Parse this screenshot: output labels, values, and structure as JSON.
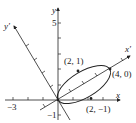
{
  "axes": {
    "x_label": "x",
    "y_label": "y",
    "xprime_label": "x′",
    "yprime_label": "y′",
    "tick_labels": {
      "x_neg3": "−3",
      "y_5": "5",
      "y_neg1": "−1"
    }
  },
  "points": [
    {
      "label": "(2, 1)"
    },
    {
      "label": "(4, 0)"
    },
    {
      "label": "(2, −1)"
    }
  ],
  "colors": {
    "stroke": "#222222",
    "background": "#ffffff"
  }
}
